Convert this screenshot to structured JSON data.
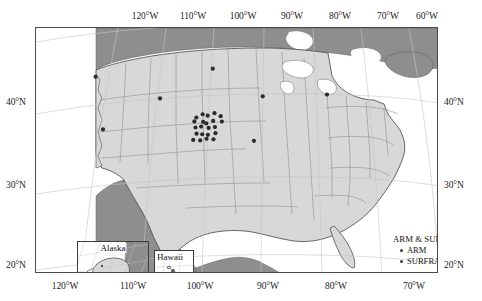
{
  "figure": {
    "type": "map",
    "projection": "conic (lambert-like) with curved graticule",
    "background_color": "#ffffff",
    "land_color": "#d6d6d6",
    "foreign_land_color": "#8a8a8a",
    "border_color": "#4a4a4a",
    "graticule_color": "#bfbfbf",
    "marker_color": "#2b2b2b"
  },
  "axes": {
    "top_labels": [
      "120°W",
      "110°W",
      "100°W",
      "90°W",
      "80°W",
      "70°W",
      "60°W"
    ],
    "top_positions_px": [
      145,
      193,
      243,
      292,
      340,
      388,
      427
    ],
    "bottom_labels": [
      "120°W",
      "110°W",
      "100°W",
      "90°W",
      "80°W",
      "70°W"
    ],
    "bottom_positions_px": [
      65,
      133,
      200,
      268,
      336,
      414
    ],
    "left_labels": [
      "40°N",
      "30°N",
      "20°N"
    ],
    "left_positions_px": [
      102,
      185,
      265
    ],
    "right_labels": [
      "40°N",
      "30°N",
      "20°N"
    ],
    "right_positions_px": [
      102,
      185,
      265
    ],
    "lon_range": [
      -127,
      -58
    ],
    "lat_range": [
      18,
      50
    ]
  },
  "legend": {
    "title": "ARM & SURFRAD",
    "entries": [
      {
        "label": "ARM",
        "marker": "filled-circle",
        "color": "#3a3a3a"
      },
      {
        "label": "SURFRAD",
        "marker": "filled-circle",
        "color": "#3a3a3a"
      }
    ]
  },
  "scalebar": {
    "labels": [
      "0",
      "150",
      "300",
      "600",
      "900",
      "1200"
    ],
    "label_positions_px": [
      0,
      19,
      33,
      63,
      97,
      131
    ],
    "unit": "mi",
    "segments": [
      {
        "start_px": 0,
        "width_px": 9,
        "fill": true
      },
      {
        "start_px": 9,
        "width_px": 9,
        "fill": false
      },
      {
        "start_px": 18,
        "width_px": 9,
        "fill": true
      },
      {
        "start_px": 27,
        "width_px": 9,
        "fill": false
      },
      {
        "start_px": 36,
        "width_px": 28,
        "fill": true
      },
      {
        "start_px": 64,
        "width_px": 34,
        "fill": false
      },
      {
        "start_px": 98,
        "width_px": 33,
        "fill": true
      },
      {
        "start_px": 131,
        "width_px": 14,
        "fill": false
      }
    ]
  },
  "insets": [
    {
      "id": "alaska",
      "title": "Alaska"
    },
    {
      "id": "hawaii",
      "title": "Hawaii"
    }
  ],
  "chart_data": {
    "type": "scatter",
    "title": "ARM & SURFRAD",
    "xlabel": "Longitude",
    "ylabel": "Latitude",
    "xlim": [
      -127,
      -58
    ],
    "ylim": [
      18,
      50
    ],
    "grid": true,
    "legend_position": "lower-right",
    "series": [
      {
        "name": "SURFRAD",
        "marker": "filled-circle",
        "color": "#2b2b2b",
        "points": [
          {
            "lon": -116.0,
            "lat": 43.6
          },
          {
            "lon": -105.1,
            "lat": 40.1
          },
          {
            "lon": -114.0,
            "lat": 36.6
          },
          {
            "lon": -88.4,
            "lat": 40.1
          },
          {
            "lon": -77.9,
            "lat": 40.7
          },
          {
            "lon": -89.9,
            "lat": 34.3
          },
          {
            "lon": -96.6,
            "lat": 43.7
          }
        ]
      },
      {
        "name": "ARM",
        "marker": "filled-circle",
        "color": "#2b2b2b",
        "points": [
          {
            "lon": -99.1,
            "lat": 37.4
          },
          {
            "lon": -98.1,
            "lat": 37.8
          },
          {
            "lon": -97.3,
            "lat": 37.6
          },
          {
            "lon": -96.2,
            "lat": 37.9
          },
          {
            "lon": -95.2,
            "lat": 37.5
          },
          {
            "lon": -99.4,
            "lat": 36.9
          },
          {
            "lon": -98.0,
            "lat": 36.8
          },
          {
            "lon": -97.5,
            "lat": 36.6
          },
          {
            "lon": -96.4,
            "lat": 36.9
          },
          {
            "lon": -95.0,
            "lat": 36.8
          },
          {
            "lon": -99.2,
            "lat": 36.1
          },
          {
            "lon": -98.3,
            "lat": 36.2
          },
          {
            "lon": -97.1,
            "lat": 36.0
          },
          {
            "lon": -96.1,
            "lat": 36.1
          },
          {
            "lon": -99.0,
            "lat": 35.3
          },
          {
            "lon": -98.1,
            "lat": 35.2
          },
          {
            "lon": -97.2,
            "lat": 35.1
          },
          {
            "lon": -96.0,
            "lat": 35.3
          },
          {
            "lon": -99.5,
            "lat": 34.5
          },
          {
            "lon": -98.4,
            "lat": 34.4
          },
          {
            "lon": -97.4,
            "lat": 34.6
          },
          {
            "lon": -96.3,
            "lat": 34.5
          }
        ]
      }
    ]
  }
}
